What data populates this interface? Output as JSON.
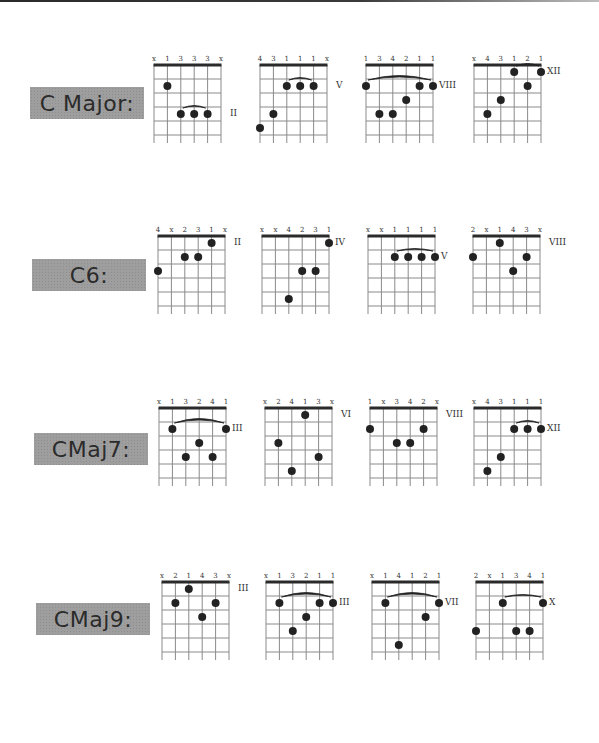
{
  "page": {
    "rows": [
      {
        "label": "C Major:",
        "diagrams": [
          {
            "fingers": [
              "x",
              "1",
              "3",
              "3",
              "3",
              "x"
            ],
            "position": "II",
            "dots": [
              [
                1,
                2
              ],
              [
                2,
                4
              ],
              [
                3,
                4
              ],
              [
                4,
                4
              ]
            ],
            "barre": {
              "from": 2,
              "to": 4,
              "fret": 4,
              "size": "small"
            }
          },
          {
            "fingers": [
              "4",
              "3",
              "1",
              "1",
              "1",
              "x"
            ],
            "position": "V",
            "dots": [
              [
                0,
                5
              ],
              [
                1,
                4
              ],
              [
                2,
                2
              ],
              [
                3,
                2
              ],
              [
                4,
                2
              ]
            ],
            "barre": {
              "from": 2,
              "to": 4,
              "fret": 2,
              "size": "small"
            }
          },
          {
            "fingers": [
              "1",
              "3",
              "4",
              "2",
              "1",
              "1"
            ],
            "position": "VIII",
            "dots": [
              [
                0,
                2
              ],
              [
                1,
                4
              ],
              [
                2,
                4
              ],
              [
                3,
                3
              ],
              [
                4,
                2
              ],
              [
                5,
                2
              ]
            ],
            "barre": {
              "from": 0,
              "to": 5,
              "fret": 2,
              "size": "large"
            }
          },
          {
            "fingers": [
              "x",
              "4",
              "3",
              "1",
              "2",
              "1"
            ],
            "position": "XII",
            "dots": [
              [
                1,
                4
              ],
              [
                2,
                3
              ],
              [
                3,
                1
              ],
              [
                4,
                2
              ],
              [
                5,
                1
              ]
            ],
            "barre": {
              "from": 3,
              "to": 5,
              "fret": 1,
              "size": "small"
            }
          }
        ]
      },
      {
        "label": "C6:",
        "diagrams": [
          {
            "fingers": [
              "4",
              "x",
              "2",
              "3",
              "1",
              "x"
            ],
            "position": "II",
            "dots": [
              [
                0,
                3
              ],
              [
                2,
                2
              ],
              [
                3,
                2
              ],
              [
                4,
                1
              ]
            ],
            "barre": null
          },
          {
            "fingers": [
              "x",
              "x",
              "4",
              "2",
              "3",
              "1"
            ],
            "position": "IV",
            "dots": [
              [
                2,
                5
              ],
              [
                3,
                3
              ],
              [
                4,
                3
              ],
              [
                5,
                1
              ]
            ],
            "barre": null
          },
          {
            "fingers": [
              "x",
              "x",
              "1",
              "1",
              "1",
              "1"
            ],
            "position": "V",
            "dots": [
              [
                2,
                2
              ],
              [
                3,
                2
              ],
              [
                4,
                2
              ],
              [
                5,
                2
              ]
            ],
            "barre": {
              "from": 2,
              "to": 5,
              "fret": 2,
              "size": "small"
            }
          },
          {
            "fingers": [
              "2",
              "x",
              "1",
              "4",
              "3",
              "x"
            ],
            "position": "VIII",
            "dots": [
              [
                0,
                2
              ],
              [
                2,
                1
              ],
              [
                3,
                3
              ],
              [
                4,
                2
              ]
            ],
            "barre": null
          }
        ]
      },
      {
        "label": "CMaj7:",
        "diagrams": [
          {
            "fingers": [
              "x",
              "1",
              "3",
              "2",
              "4",
              "1"
            ],
            "position": "III",
            "dots": [
              [
                1,
                2
              ],
              [
                2,
                4
              ],
              [
                3,
                3
              ],
              [
                4,
                4
              ],
              [
                5,
                2
              ]
            ],
            "barre": {
              "from": 1,
              "to": 5,
              "fret": 2,
              "size": "large"
            }
          },
          {
            "fingers": [
              "x",
              "2",
              "4",
              "1",
              "3",
              "x"
            ],
            "position": "VI",
            "dots": [
              [
                1,
                3
              ],
              [
                2,
                5
              ],
              [
                3,
                1
              ],
              [
                4,
                4
              ]
            ],
            "barre": null
          },
          {
            "fingers": [
              "1",
              "x",
              "3",
              "4",
              "2",
              "x"
            ],
            "position": "VIII",
            "dots": [
              [
                0,
                2
              ],
              [
                2,
                3
              ],
              [
                3,
                3
              ],
              [
                4,
                2
              ]
            ],
            "barre": null
          },
          {
            "fingers": [
              "x",
              "4",
              "3",
              "1",
              "1",
              "1"
            ],
            "position": "XII",
            "dots": [
              [
                1,
                5
              ],
              [
                2,
                4
              ],
              [
                3,
                2
              ],
              [
                4,
                2
              ],
              [
                5,
                2
              ]
            ],
            "barre": {
              "from": 3,
              "to": 5,
              "fret": 2,
              "size": "small"
            }
          }
        ]
      },
      {
        "label": "CMaj9:",
        "diagrams": [
          {
            "fingers": [
              "x",
              "2",
              "1",
              "4",
              "3",
              "x"
            ],
            "position": "III",
            "dots": [
              [
                1,
                2
              ],
              [
                2,
                1
              ],
              [
                3,
                3
              ],
              [
                4,
                2
              ]
            ],
            "barre": null
          },
          {
            "fingers": [
              "x",
              "1",
              "3",
              "2",
              "1",
              "1"
            ],
            "position": "III",
            "dots": [
              [
                1,
                2
              ],
              [
                2,
                4
              ],
              [
                3,
                3
              ],
              [
                4,
                2
              ],
              [
                5,
                2
              ]
            ],
            "barre": {
              "from": 1,
              "to": 5,
              "fret": 2,
              "size": "large"
            }
          },
          {
            "fingers": [
              "x",
              "1",
              "4",
              "1",
              "2",
              "1"
            ],
            "position": "VII",
            "dots": [
              [
                1,
                2
              ],
              [
                2,
                5
              ],
              [
                4,
                3
              ],
              [
                5,
                2
              ]
            ],
            "barre": {
              "from": 1,
              "to": 5,
              "fret": 2,
              "size": "large"
            }
          },
          {
            "fingers": [
              "2",
              "x",
              "1",
              "3",
              "4",
              "1"
            ],
            "position": "X",
            "dots": [
              [
                0,
                4
              ],
              [
                2,
                2
              ],
              [
                3,
                4
              ],
              [
                4,
                4
              ],
              [
                5,
                2
              ]
            ],
            "barre": {
              "from": 2,
              "to": 5,
              "fret": 2,
              "size": "small"
            }
          }
        ]
      }
    ]
  },
  "colors": {
    "label_bg": "#9e9e9e",
    "label_text": "#2b2b2b",
    "ink": "#222222",
    "grid": "#8a8a8a"
  }
}
